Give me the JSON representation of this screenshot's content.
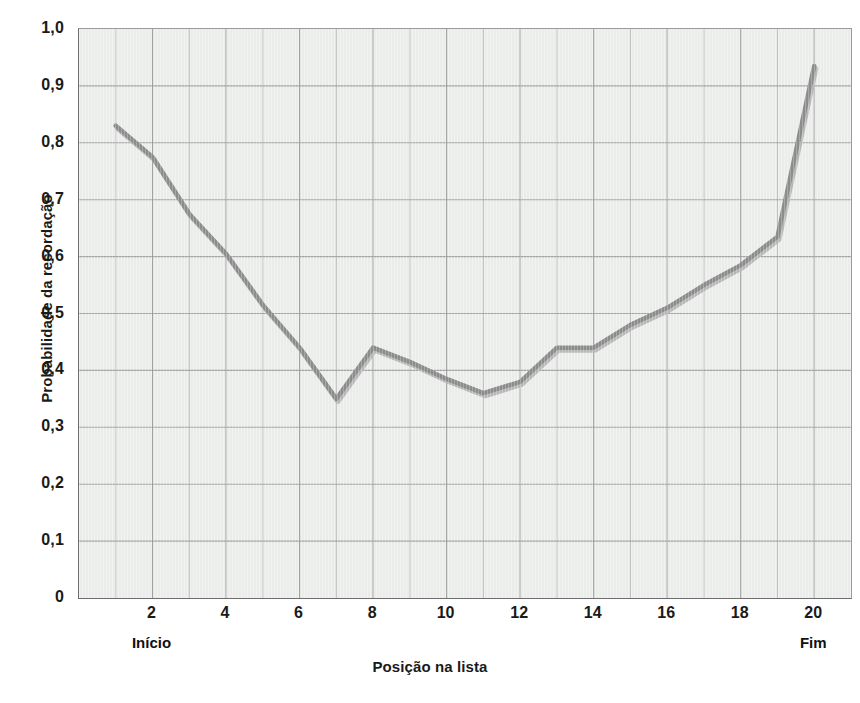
{
  "chart_data": {
    "type": "line",
    "title": "",
    "xlabel": "Posição na lista",
    "ylabel": "Probabilidade da recordação",
    "xlim": [
      0,
      21
    ],
    "ylim": [
      0,
      1.0
    ],
    "grid": true,
    "legend": false,
    "line_color": "#8d8d8d",
    "highlight_color": "#b9b9b9",
    "plot_background": "#edefed",
    "gridline_color": "#9b9b9b",
    "x": [
      1,
      2,
      3,
      4,
      5,
      6,
      7,
      8,
      9,
      10,
      11,
      12,
      13,
      14,
      15,
      16,
      17,
      18,
      19,
      20
    ],
    "values": [
      0.83,
      0.775,
      0.675,
      0.605,
      0.515,
      0.44,
      0.35,
      0.44,
      0.415,
      0.385,
      0.36,
      0.38,
      0.44,
      0.44,
      0.48,
      0.51,
      0.55,
      0.585,
      0.635,
      0.935
    ],
    "categories": [
      "1",
      "2",
      "3",
      "4",
      "5",
      "6",
      "7",
      "8",
      "9",
      "10",
      "11",
      "12",
      "13",
      "14",
      "15",
      "16",
      "17",
      "18",
      "19",
      "20"
    ],
    "series": [
      {
        "name": "Probabilidade da recordação",
        "values": [
          0.83,
          0.775,
          0.675,
          0.605,
          0.515,
          0.44,
          0.35,
          0.44,
          0.415,
          0.385,
          0.36,
          0.38,
          0.44,
          0.44,
          0.48,
          0.51,
          0.55,
          0.585,
          0.635,
          0.935
        ]
      }
    ],
    "x_tick_labels": [
      "2",
      "4",
      "6",
      "8",
      "10",
      "12",
      "14",
      "16",
      "18",
      "20"
    ],
    "x_tick_values": [
      2,
      4,
      6,
      8,
      10,
      12,
      14,
      16,
      18,
      20
    ],
    "y_tick_labels": [
      "1,0",
      "0,9",
      "0,8",
      "0,7",
      "0,6",
      "0,5",
      "0,4",
      "0,3",
      "0,2",
      "0,1",
      "0"
    ],
    "y_tick_values": [
      1.0,
      0.9,
      0.8,
      0.7,
      0.6,
      0.5,
      0.4,
      0.3,
      0.2,
      0.1,
      0
    ],
    "annotations": [
      {
        "text": "Início",
        "x": 2
      },
      {
        "text": "Fim",
        "x": 20
      }
    ]
  }
}
